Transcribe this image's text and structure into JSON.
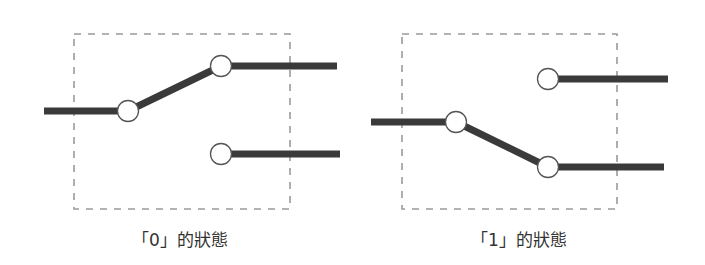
{
  "colors": {
    "background": "#ffffff",
    "wire": "#3a3a3a",
    "dashed_box": "#9a9a9a",
    "contact_fill": "#ffffff",
    "contact_stroke": "#555555",
    "caption": "#333333"
  },
  "diagrams": [
    {
      "id": "state-0",
      "caption": "「0」的狀態",
      "box": {
        "x": 74,
        "y": 34,
        "w": 216,
        "h": 175
      },
      "input_line": {
        "x1": 44,
        "y1": 111,
        "x2": 128,
        "y2": 111
      },
      "pivot": {
        "cx": 128,
        "cy": 111
      },
      "lever": {
        "x1": 128,
        "y1": 111,
        "x2": 221,
        "y2": 66
      },
      "top_contact": {
        "cx": 221,
        "cy": 66
      },
      "top_output": {
        "x1": 221,
        "y1": 66,
        "x2": 337,
        "y2": 66
      },
      "bottom_contact": {
        "cx": 221,
        "cy": 154
      },
      "bottom_output": {
        "x1": 221,
        "y1": 154,
        "x2": 340,
        "y2": 154
      },
      "caption_pos": {
        "x": 180,
        "y": 226
      }
    },
    {
      "id": "state-1",
      "caption": "「1」的狀態",
      "box": {
        "x": 402,
        "y": 34,
        "w": 215,
        "h": 175
      },
      "input_line": {
        "x1": 371,
        "y1": 122,
        "x2": 456,
        "y2": 122
      },
      "pivot": {
        "cx": 456,
        "cy": 122
      },
      "lever": {
        "x1": 456,
        "y1": 122,
        "x2": 548,
        "y2": 167
      },
      "top_contact": {
        "cx": 548,
        "cy": 79
      },
      "top_output": {
        "x1": 548,
        "y1": 79,
        "x2": 668,
        "y2": 79
      },
      "bottom_contact": {
        "cx": 548,
        "cy": 167
      },
      "bottom_output": {
        "x1": 548,
        "y1": 167,
        "x2": 664,
        "y2": 167
      },
      "caption_pos": {
        "x": 519,
        "y": 226
      }
    }
  ]
}
